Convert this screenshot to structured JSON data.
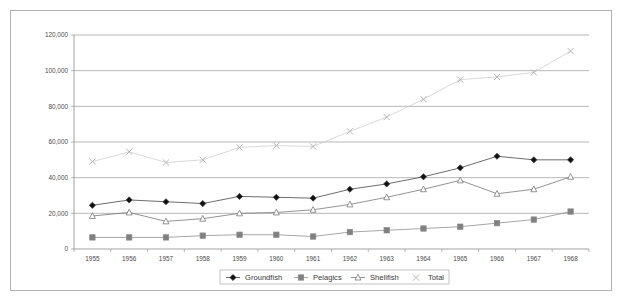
{
  "chart_data": {
    "type": "line",
    "title": "",
    "xlabel": "",
    "ylabel": "",
    "categories": [
      "1955",
      "1956",
      "1957",
      "1958",
      "1959",
      "1960",
      "1961",
      "1962",
      "1963",
      "1964",
      "1965",
      "1966",
      "1967",
      "1968"
    ],
    "x": [
      1955,
      1956,
      1957,
      1958,
      1959,
      1960,
      1961,
      1962,
      1963,
      1964,
      1965,
      1966,
      1967,
      1968
    ],
    "ylim": [
      0,
      120000
    ],
    "xlim": [
      1955,
      1968
    ],
    "yticks": [
      0,
      20000,
      40000,
      60000,
      80000,
      100000,
      120000
    ],
    "ytick_labels": [
      "0",
      "20,000",
      "40,000",
      "60,000",
      "80,000",
      "100,000",
      "120,000"
    ],
    "grid": true,
    "legend_position": "bottom",
    "series": [
      {
        "name": "Groundfish",
        "marker": "diamond",
        "color": "#3c3c3c",
        "marker_fill": "#111111",
        "values": [
          24500,
          27500,
          26500,
          25500,
          29500,
          29000,
          28500,
          33500,
          36500,
          40500,
          45500,
          52000,
          50000,
          50000
        ]
      },
      {
        "name": "Pelagics",
        "marker": "square",
        "color": "#8a8a8a",
        "marker_fill": "#808080",
        "values": [
          6500,
          6500,
          6500,
          7500,
          8000,
          8000,
          7000,
          9500,
          10500,
          11500,
          12500,
          14500,
          16500,
          21000
        ]
      },
      {
        "name": "Shellfish",
        "marker": "triangle",
        "color": "#707070",
        "marker_fill": "#ffffff",
        "values": [
          18500,
          20500,
          15500,
          17000,
          20000,
          20500,
          22000,
          25000,
          29000,
          33500,
          38500,
          31000,
          33500,
          40500
        ]
      },
      {
        "name": "Total",
        "marker": "cross",
        "color": "#cccccc",
        "marker_fill": "#b5b5b5",
        "values": [
          49000,
          54500,
          48500,
          50000,
          57000,
          58000,
          57500,
          66000,
          74000,
          84000,
          95000,
          96500,
          99000,
          111000
        ]
      }
    ]
  },
  "legend": {
    "items": [
      {
        "label": "Groundfish",
        "marker": "diamond-marker"
      },
      {
        "label": "Pelagics",
        "marker": "square-marker"
      },
      {
        "label": "Shellfish",
        "marker": "triangle-marker"
      },
      {
        "label": "Total",
        "marker": "cross-marker"
      }
    ]
  }
}
